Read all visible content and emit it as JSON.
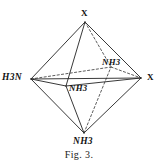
{
  "figure": {
    "caption": "Fig. 3.",
    "shape": "octahedron",
    "background_color": "#ffffff",
    "ink_color": "#222222",
    "vertices": {
      "top": {
        "label": "X",
        "x": 85,
        "y": 22
      },
      "left": {
        "label": "H3N",
        "x": 31,
        "y": 79
      },
      "right": {
        "label": "X",
        "x": 141,
        "y": 78
      },
      "bottom": {
        "label": "NH3",
        "x": 84,
        "y": 133
      },
      "front": {
        "label": "NH3",
        "x": 66,
        "y": 86
      },
      "back": {
        "label": "NH3",
        "x": 111,
        "y": 67
      }
    },
    "edges": [
      {
        "from": "top",
        "to": "left",
        "style": "solid"
      },
      {
        "from": "top",
        "to": "right",
        "style": "solid"
      },
      {
        "from": "top",
        "to": "front",
        "style": "solid"
      },
      {
        "from": "top",
        "to": "back",
        "style": "hidden"
      },
      {
        "from": "bottom",
        "to": "left",
        "style": "solid"
      },
      {
        "from": "bottom",
        "to": "right",
        "style": "solid"
      },
      {
        "from": "bottom",
        "to": "front",
        "style": "solid"
      },
      {
        "from": "bottom",
        "to": "back",
        "style": "hidden"
      },
      {
        "from": "left",
        "to": "front",
        "style": "solid"
      },
      {
        "from": "front",
        "to": "right",
        "style": "solid"
      },
      {
        "from": "left",
        "to": "back",
        "style": "hidden"
      },
      {
        "from": "back",
        "to": "right",
        "style": "hidden"
      }
    ]
  }
}
